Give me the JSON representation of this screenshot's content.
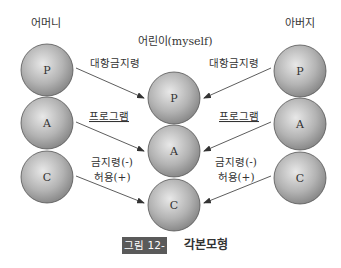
{
  "columns": {
    "mother": {
      "title": "어머니",
      "circles": [
        "P",
        "A",
        "C"
      ]
    },
    "child": {
      "title": "어린이(myself)",
      "circles": [
        "P",
        "A",
        "C"
      ]
    },
    "father": {
      "title": "아버지",
      "circles": [
        "P",
        "A",
        "C"
      ]
    }
  },
  "arrows": {
    "left": [
      "대항금지령",
      "프로그램",
      "금지령(-)",
      "허용(+)"
    ],
    "right": [
      "대항금지령",
      "프로그램",
      "금지령(-)",
      "허용(+)"
    ]
  },
  "caption": {
    "number": "그림 12-13",
    "title": "각본모형"
  },
  "colors": {
    "sphere_light": "#e6e6e6",
    "sphere_dark": "#8a8a8a",
    "caption_bg": "#5a5a5a"
  }
}
